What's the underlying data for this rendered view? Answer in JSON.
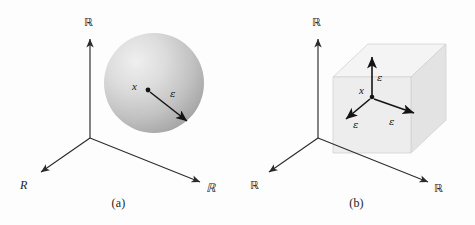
{
  "figure": {
    "background_color": "#fdfdfd",
    "stroke_color": "#2b2b2b"
  },
  "panels": [
    {
      "id": "a",
      "caption": "(a)",
      "shape": "sphere",
      "shape_fill_light": "#e8e8e8",
      "shape_fill_dark": "#a9a9a9",
      "axes": [
        {
          "name": "vertical-axis",
          "label": "ℝ",
          "style": "blackboard"
        },
        {
          "name": "left-axis",
          "label": "R",
          "style": "italic"
        },
        {
          "name": "right-axis",
          "label": "ℝ",
          "style": "blackboard"
        }
      ],
      "point_label": "x",
      "radius_labels": [
        "ε"
      ]
    },
    {
      "id": "b",
      "caption": "(b)",
      "shape": "cube",
      "shape_fill_front": "#ececec",
      "shape_fill_top": "#f3f3f3",
      "shape_fill_side": "#e2e2e2",
      "axes": [
        {
          "name": "vertical-axis",
          "label": "ℝ",
          "style": "blackboard"
        },
        {
          "name": "left-axis",
          "label": "ℝ",
          "style": "blackboard"
        },
        {
          "name": "right-axis",
          "label": "ℝ",
          "style": "blackboard"
        }
      ],
      "point_label": "x",
      "radius_labels": [
        "ε",
        "ε",
        "ε"
      ]
    }
  ]
}
